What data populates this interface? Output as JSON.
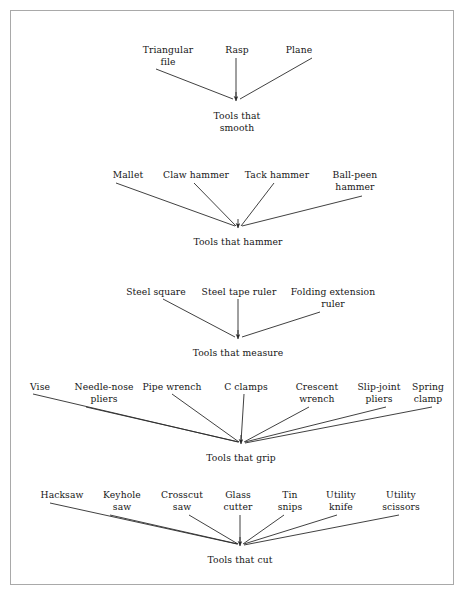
{
  "diagram": {
    "background_color": "#ffffff",
    "border_color": "#a9a9a9",
    "line_color": "#2b2b2b",
    "text_color": "#161616",
    "groups": [
      {
        "id": "smooth",
        "root": {
          "label": "Tools that\nsmooth",
          "x": 237,
          "y": 110
        },
        "apex": {
          "x": 236,
          "y": 101
        },
        "leaves": [
          {
            "label": "Triangular\nfile",
            "x": 168,
            "y": 44,
            "line": {
              "x1": 156,
              "y1": 69,
              "x2": 233,
              "y2": 99
            }
          },
          {
            "label": "Rasp",
            "x": 237,
            "y": 44,
            "line": {
              "x1": 236,
              "y1": 58,
              "x2": 236,
              "y2": 99
            }
          },
          {
            "label": "Plane",
            "x": 299,
            "y": 44,
            "line": {
              "x1": 312,
              "y1": 58,
              "x2": 240,
              "y2": 99
            }
          }
        ]
      },
      {
        "id": "hammer",
        "root": {
          "label": "Tools that hammer",
          "x": 238,
          "y": 236
        },
        "apex": {
          "x": 238,
          "y": 228
        },
        "leaves": [
          {
            "label": "Mallet",
            "x": 128,
            "y": 169,
            "line": {
              "x1": 116,
              "y1": 183,
              "x2": 235,
              "y2": 226
            }
          },
          {
            "label": "Claw hammer",
            "x": 196,
            "y": 169,
            "line": {
              "x1": 194,
              "y1": 183,
              "x2": 236,
              "y2": 226
            }
          },
          {
            "label": "Tack hammer",
            "x": 277,
            "y": 169,
            "line": {
              "x1": 274,
              "y1": 183,
              "x2": 241,
              "y2": 226
            }
          },
          {
            "label": "Ball-peen\nhammer",
            "x": 355,
            "y": 169,
            "line": {
              "x1": 362,
              "y1": 196,
              "x2": 242,
              "y2": 226
            }
          }
        ]
      },
      {
        "id": "measure",
        "root": {
          "label": "Tools that measure",
          "x": 238,
          "y": 347
        },
        "apex": {
          "x": 238,
          "y": 339
        },
        "leaves": [
          {
            "label": "Steel square",
            "x": 156,
            "y": 286,
            "line": {
              "x1": 163,
              "y1": 299,
              "x2": 235,
              "y2": 337
            }
          },
          {
            "label": "Steel tape ruler",
            "x": 239,
            "y": 286,
            "line": {
              "x1": 238,
              "y1": 299,
              "x2": 238,
              "y2": 337
            }
          },
          {
            "label": "Folding extension\nruler",
            "x": 333,
            "y": 286,
            "line": {
              "x1": 320,
              "y1": 312,
              "x2": 242,
              "y2": 337
            }
          }
        ]
      },
      {
        "id": "grip",
        "root": {
          "label": "Tools that grip",
          "x": 241,
          "y": 452
        },
        "apex": {
          "x": 241,
          "y": 444
        },
        "leaves": [
          {
            "label": "Vise",
            "x": 40,
            "y": 381,
            "line": {
              "x1": 33,
              "y1": 394,
              "x2": 238,
              "y2": 442
            }
          },
          {
            "label": "Needle-nose\npliers",
            "x": 104,
            "y": 381,
            "line": {
              "x1": 86,
              "y1": 407,
              "x2": 239,
              "y2": 442
            }
          },
          {
            "label": "Pipe wrench",
            "x": 172,
            "y": 381,
            "line": {
              "x1": 172,
              "y1": 394,
              "x2": 239,
              "y2": 442
            }
          },
          {
            "label": "C clamps",
            "x": 246,
            "y": 381,
            "line": {
              "x1": 244,
              "y1": 394,
              "x2": 241,
              "y2": 442
            }
          },
          {
            "label": "Crescent\nwrench",
            "x": 317,
            "y": 381,
            "line": {
              "x1": 309,
              "y1": 407,
              "x2": 244,
              "y2": 442
            }
          },
          {
            "label": "Slip-joint\npliers",
            "x": 379,
            "y": 381,
            "line": {
              "x1": 386,
              "y1": 407,
              "x2": 245,
              "y2": 442
            }
          },
          {
            "label": "Spring\nclamp",
            "x": 428,
            "y": 381,
            "line": {
              "x1": 432,
              "y1": 407,
              "x2": 245,
              "y2": 443
            }
          }
        ]
      },
      {
        "id": "cut",
        "root": {
          "label": "Tools that cut",
          "x": 240,
          "y": 554
        },
        "apex": {
          "x": 240,
          "y": 546
        },
        "leaves": [
          {
            "label": "Hacksaw",
            "x": 62,
            "y": 489,
            "line": {
              "x1": 50,
              "y1": 503,
              "x2": 237,
              "y2": 544
            }
          },
          {
            "label": "Keyhole\nsaw",
            "x": 122,
            "y": 489,
            "line": {
              "x1": 110,
              "y1": 515,
              "x2": 238,
              "y2": 544
            }
          },
          {
            "label": "Crosscut\nsaw",
            "x": 182,
            "y": 489,
            "line": {
              "x1": 189,
              "y1": 515,
              "x2": 238,
              "y2": 544
            }
          },
          {
            "label": "Glass\ncutter",
            "x": 238,
            "y": 489,
            "line": {
              "x1": 240,
              "y1": 515,
              "x2": 240,
              "y2": 544
            }
          },
          {
            "label": "Tin\nsnips",
            "x": 290,
            "y": 489,
            "line": {
              "x1": 284,
              "y1": 515,
              "x2": 243,
              "y2": 544
            }
          },
          {
            "label": "Utility\nknife",
            "x": 341,
            "y": 489,
            "line": {
              "x1": 337,
              "y1": 515,
              "x2": 244,
              "y2": 544
            }
          },
          {
            "label": "Utility\nscissors",
            "x": 401,
            "y": 489,
            "line": {
              "x1": 399,
              "y1": 515,
              "x2": 244,
              "y2": 545
            }
          }
        ]
      }
    ]
  }
}
